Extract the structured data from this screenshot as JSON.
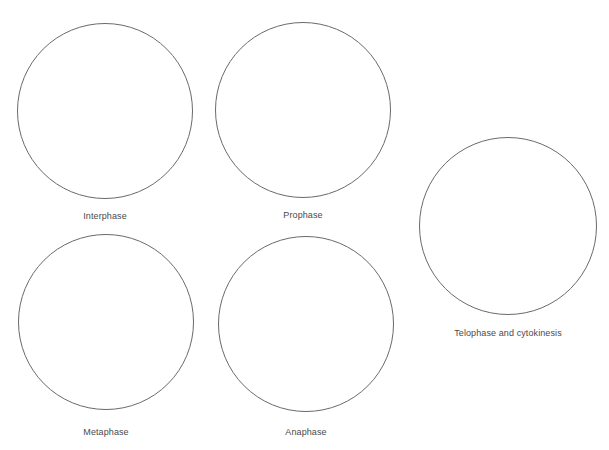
{
  "diagram": {
    "title": "",
    "stages": [
      {
        "id": "interphase",
        "label": "Interphase",
        "cx": 105,
        "cy": 111,
        "r": 88,
        "label_y": 211
      },
      {
        "id": "prophase",
        "label": "Prophase",
        "cx": 303,
        "cy": 110,
        "r": 88,
        "label_y": 210
      },
      {
        "id": "telophase",
        "label": "Telophase and cytokinesis",
        "cx": 508,
        "cy": 226,
        "r": 89,
        "label_y": 328
      },
      {
        "id": "metaphase",
        "label": "Metaphase",
        "cx": 106,
        "cy": 322,
        "r": 88,
        "label_y": 427
      },
      {
        "id": "anaphase",
        "label": "Anaphase",
        "cx": 306,
        "cy": 324,
        "r": 88,
        "label_y": 427
      }
    ],
    "circle_color": "#6a6a6a",
    "label_color": "#4a4a4a"
  }
}
